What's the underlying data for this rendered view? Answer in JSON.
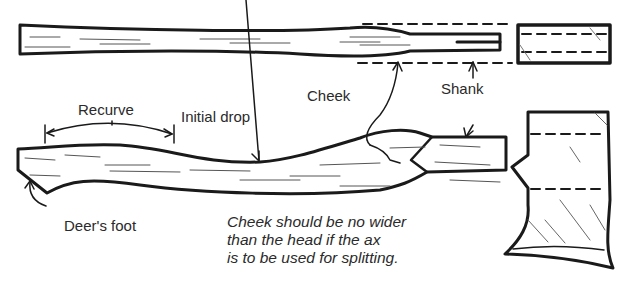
{
  "diagram": {
    "labels": {
      "recurve": "Recurve",
      "initial_drop": "Initial drop",
      "cheek": "Cheek",
      "shank": "Shank",
      "deers_foot": "Deer's foot"
    },
    "note": {
      "lines": [
        "Cheek should be no wider",
        "than the head if the ax",
        "is to be used for splitting."
      ]
    },
    "views": [
      {
        "name": "handle-top-view",
        "description": "Handle seen from above, cheek bulge with dashed head-width guides"
      },
      {
        "name": "head-top-view",
        "description": "Ax head seen from above"
      },
      {
        "name": "handle-side-view",
        "description": "Handle side profile with recurve, initial drop, cheek, shank and deer's foot"
      },
      {
        "name": "head-side-view",
        "description": "Ax head side profile with eye and curved bit"
      }
    ],
    "colors": {
      "ink": "#1a1a1a",
      "background": "#ffffff"
    }
  }
}
